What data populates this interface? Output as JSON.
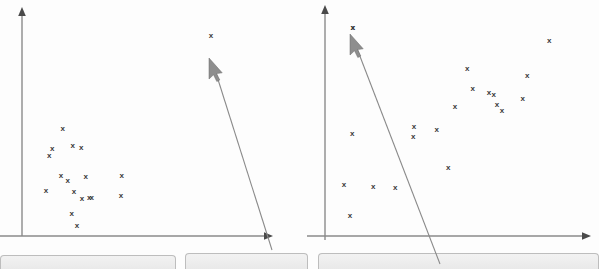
{
  "figure": {
    "background_color": "#fdfdfd",
    "axis_color": "#8a8a8a",
    "point_color": "#3a3a3a",
    "point_glyph": "x",
    "cursor_color": "#8e8e8e",
    "panel_fill": "#eeeeee",
    "panel_border": "#bdbdbd"
  },
  "chart_data": [
    {
      "type": "scatter",
      "name": "left-panel",
      "title": "",
      "xlabel": "",
      "ylabel": "",
      "marker": "x",
      "grid": false,
      "legend": "none",
      "axis_origin": [
        22,
        236
      ],
      "x_axis_end": [
        272,
        236
      ],
      "y_axis_top": [
        22,
        10
      ],
      "xlim": [
        22,
        272
      ],
      "ylim": [
        10,
        236
      ],
      "point_count": 17,
      "points": [
        [
          62.7,
          129.0
        ],
        [
          52.3,
          149.0
        ],
        [
          49.3,
          156.0
        ],
        [
          72.7,
          145.7
        ],
        [
          81.3,
          148.0
        ],
        [
          61.0,
          175.7
        ],
        [
          67.7,
          180.7
        ],
        [
          85.7,
          176.7
        ],
        [
          121.7,
          175.7
        ],
        [
          46.0,
          191.0
        ],
        [
          74.0,
          192.0
        ],
        [
          82.0,
          199.3
        ],
        [
          89.3,
          197.7
        ],
        [
          91.7,
          198.3
        ],
        [
          121.0,
          196.3
        ],
        [
          71.7,
          213.7
        ],
        [
          77.0,
          225.7
        ]
      ],
      "annotation": {
        "kind": "mouse-cursor",
        "tip": [
          210,
          62
        ],
        "tail": [
          272,
          248
        ],
        "extra_point": [
          211,
          36
        ]
      }
    },
    {
      "type": "scatter",
      "name": "right-panel",
      "title": "",
      "xlabel": "",
      "ylabel": "",
      "marker": "x",
      "grid": false,
      "legend": "none",
      "axis_origin": [
        325,
        236
      ],
      "x_axis_end": [
        590,
        236
      ],
      "y_axis_top": [
        325,
        7
      ],
      "xlim": [
        325,
        590
      ],
      "ylim": [
        7,
        236
      ],
      "point_count": 20,
      "points": [
        [
          352.7,
          28.3
        ],
        [
          549.3,
          41.0
        ],
        [
          467.3,
          69.3
        ],
        [
          527.3,
          75.7
        ],
        [
          472.7,
          89.3
        ],
        [
          489.0,
          93.3
        ],
        [
          493.7,
          94.7
        ],
        [
          522.7,
          99.3
        ],
        [
          497.0,
          105.0
        ],
        [
          455.0,
          106.7
        ],
        [
          502.0,
          111.0
        ],
        [
          414.0,
          126.7
        ],
        [
          436.7,
          129.7
        ],
        [
          352.3,
          134.0
        ],
        [
          413.3,
          137.3
        ],
        [
          448.3,
          168.3
        ],
        [
          344.0,
          185.3
        ],
        [
          373.3,
          187.0
        ],
        [
          395.3,
          188.0
        ],
        [
          350.0,
          215.7
        ]
      ],
      "annotation": {
        "kind": "mouse-cursor",
        "tip": [
          353,
          38
        ],
        "tail": [
          440,
          262
        ],
        "extra_point": [
          353,
          28
        ]
      }
    }
  ],
  "bottom_panels": [
    {
      "name": "panel-left",
      "x": 0,
      "y": 255,
      "width": 176,
      "height": 14,
      "label": ""
    },
    {
      "name": "panel-center",
      "x": 185,
      "y": 253,
      "width": 123,
      "height": 16,
      "label": ""
    },
    {
      "name": "panel-right",
      "x": 318,
      "y": 253,
      "width": 281,
      "height": 16,
      "label": ""
    }
  ]
}
